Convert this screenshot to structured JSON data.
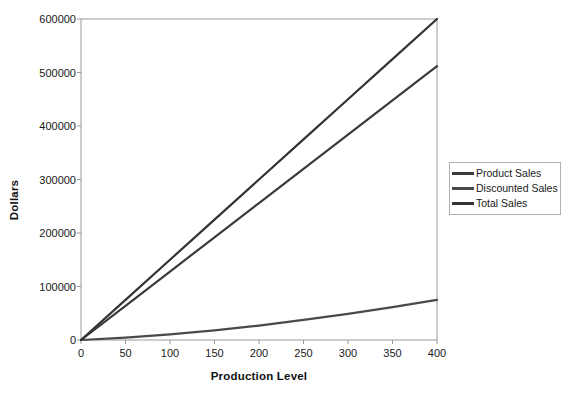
{
  "chart_data": {
    "type": "line",
    "title": "",
    "xlabel": "Production Level",
    "ylabel": "Dollars",
    "xlim": [
      0,
      400
    ],
    "ylim": [
      0,
      600000
    ],
    "xticks": [
      0,
      50,
      100,
      150,
      200,
      250,
      300,
      350,
      400
    ],
    "xtick_labels": [
      "0",
      "50",
      "100",
      "150",
      "200",
      "250",
      "300",
      "350",
      "400"
    ],
    "yticks": [
      0,
      100000,
      200000,
      300000,
      400000,
      500000,
      600000
    ],
    "ytick_labels": [
      "0",
      "100000",
      "200000",
      "300000",
      "400000",
      "500000",
      "600000"
    ],
    "grid": false,
    "legend_position": "right",
    "x": [
      0,
      50,
      100,
      150,
      200,
      250,
      300,
      350,
      400
    ],
    "series": [
      {
        "name": "Product Sales",
        "color": "#3a3a3a",
        "values": [
          0,
          64000,
          128000,
          192000,
          256000,
          320000,
          384000,
          448000,
          512000
        ]
      },
      {
        "name": "Discounted Sales",
        "color": "#4a4a4a",
        "values": [
          0,
          4500,
          10500,
          18000,
          27000,
          37500,
          49000,
          61500,
          75000
        ]
      },
      {
        "name": "Total Sales",
        "color": "#333333",
        "values": [
          0,
          75000,
          150000,
          225000,
          300000,
          375000,
          450000,
          525000,
          600000
        ]
      }
    ]
  },
  "legend": {
    "items": [
      {
        "label": "Product Sales"
      },
      {
        "label": "Discounted Sales"
      },
      {
        "label": "Total Sales"
      }
    ]
  },
  "axes": {
    "frame_color": "#9a9a9a",
    "line_color": "#3a3a3a"
  }
}
